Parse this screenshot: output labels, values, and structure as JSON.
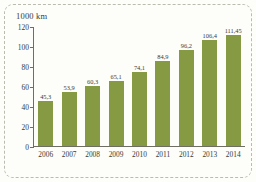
{
  "chart_data": {
    "type": "bar",
    "title": "1000 km",
    "xlabel": "",
    "ylabel": "1000 km",
    "categories": [
      "2006",
      "2007",
      "2008",
      "2009",
      "2010",
      "2011",
      "2012",
      "2013",
      "2014"
    ],
    "values": [
      45.3,
      53.9,
      60.3,
      65.1,
      74.1,
      84.9,
      96.2,
      106.4,
      111.45
    ],
    "value_labels": [
      "45,3",
      "53,9",
      "60,3",
      "65,1",
      "74,1",
      "84,9",
      "96,2",
      "106,4",
      "111,45"
    ],
    "ylim": [
      0,
      120
    ],
    "yticks": [
      0,
      20,
      40,
      60,
      80,
      100,
      120
    ],
    "ytick_labels": [
      "0",
      "20",
      "40",
      "60",
      "80",
      "100",
      "120"
    ],
    "grid": false,
    "legend": null,
    "bar_color": "#869a43",
    "axis_color": "#6e6e62",
    "text_color": "#3a3a34",
    "frame_color": "#b9bcae",
    "background": "#fdfdfa"
  }
}
